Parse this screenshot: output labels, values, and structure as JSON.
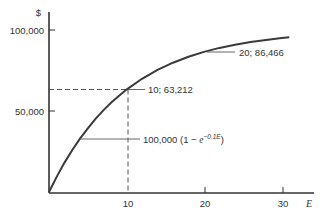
{
  "chart_data": {
    "type": "line",
    "title": "",
    "xlabel": "E",
    "ylabel": "$",
    "function": "100,000 (1 − e^(−0.1E))",
    "xlim": [
      0,
      34
    ],
    "ylim": [
      0,
      105000
    ],
    "x_ticks": [
      10,
      20,
      30
    ],
    "x_tick_labels": [
      "10",
      "20",
      "30"
    ],
    "y_ticks": [
      50000,
      100000
    ],
    "y_tick_labels": [
      "50,000",
      "100,000"
    ],
    "grid": false,
    "legend": null,
    "series": [
      {
        "name": "100,000 (1 − e^(−0.1E))",
        "x": [
          0,
          1,
          2,
          3,
          4,
          5,
          6,
          7,
          8,
          9,
          10,
          12,
          14,
          16,
          18,
          20,
          22,
          24,
          26,
          28,
          30,
          31
        ],
        "values": [
          0,
          9516,
          18127,
          25918,
          32968,
          39347,
          45119,
          50341,
          55067,
          59343,
          63212,
          69881,
          75340,
          79810,
          83470,
          86466,
          88920,
          90928,
          92573,
          93919,
          95021,
          95495
        ]
      }
    ],
    "annotations": [
      {
        "text": "10; 63,212",
        "x": 10,
        "y": 63212,
        "dashed_guides": true
      },
      {
        "text": "20; 86,466",
        "x": 20,
        "y": 86466
      },
      {
        "text_prefix": "100,000 (1 − ",
        "text_base": "e",
        "text_sup": "−0.1E",
        "text_suffix": ")",
        "x": 4,
        "y": 32968
      }
    ]
  }
}
